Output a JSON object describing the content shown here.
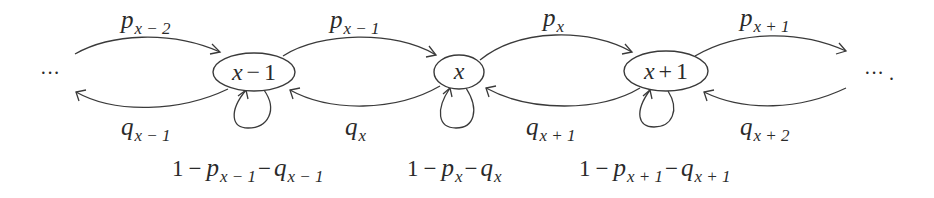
{
  "diagram": {
    "type": "birth-death Markov chain transition diagram",
    "nodes": [
      {
        "id": "x-1",
        "label": "x − 1",
        "var": "x",
        "op": "−",
        "num": "1"
      },
      {
        "id": "x",
        "label": "x",
        "var": "x",
        "op": "",
        "num": ""
      },
      {
        "id": "x+1",
        "label": "x + 1",
        "var": "x",
        "op": "+",
        "num": "1"
      }
    ],
    "forward_edges": [
      {
        "from": "…",
        "to": "x-1",
        "label": "p_{x−2}",
        "base": "p",
        "sub": "x − 2"
      },
      {
        "from": "x-1",
        "to": "x",
        "label": "p_{x−1}",
        "base": "p",
        "sub": "x − 1"
      },
      {
        "from": "x",
        "to": "x+1",
        "label": "p_x",
        "base": "p",
        "sub": "x"
      },
      {
        "from": "x+1",
        "to": "…",
        "label": "p_{x+1}",
        "base": "p",
        "sub": "x + 1"
      }
    ],
    "backward_edges": [
      {
        "from": "x-1",
        "to": "…",
        "label": "q_{x−1}",
        "base": "q",
        "sub": "x − 1"
      },
      {
        "from": "x",
        "to": "x-1",
        "label": "q_x",
        "base": "q",
        "sub": "x"
      },
      {
        "from": "x+1",
        "to": "x",
        "label": "q_{x+1}",
        "base": "q",
        "sub": "x + 1"
      },
      {
        "from": "…",
        "to": "x+1",
        "label": "q_{x+2}",
        "base": "q",
        "sub": "x + 2"
      }
    ],
    "self_loops": [
      {
        "node": "x-1",
        "label": "1 − p_{x−1} − q_{x−1}",
        "one": "1",
        "minus": "−",
        "p_sub": "x − 1",
        "q_sub": "x − 1"
      },
      {
        "node": "x",
        "label": "1 − p_x − q_x",
        "one": "1",
        "minus": "−",
        "p_sub": "x",
        "q_sub": "x"
      },
      {
        "node": "x+1",
        "label": "1 − p_{x+1} − q_{x+1}",
        "one": "1",
        "minus": "−",
        "p_sub": "x + 1",
        "q_sub": "x + 1"
      }
    ],
    "left_ellipsis": "···",
    "right_ellipsis": "··· ."
  }
}
